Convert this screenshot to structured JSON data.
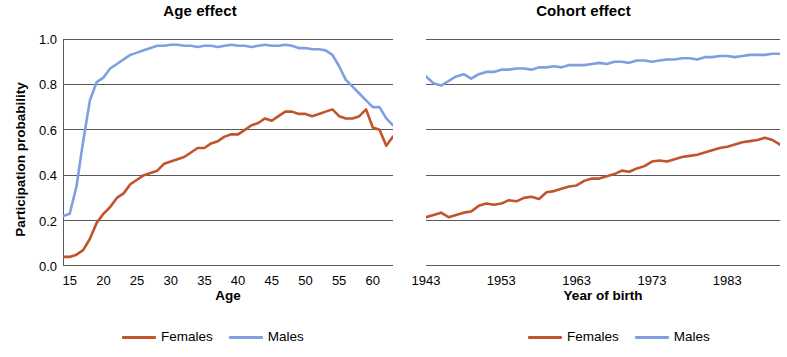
{
  "chart_data": [
    {
      "type": "line",
      "title": "Age effect",
      "xlabel": "Age",
      "ylabel": "Participation probability",
      "xlim": [
        14,
        63
      ],
      "ylim": [
        0.0,
        1.0
      ],
      "grid": true,
      "legend_position": "bottom",
      "xticks": [
        "15",
        "20",
        "25",
        "30",
        "35",
        "40",
        "45",
        "50",
        "55",
        "60"
      ],
      "xtick_values": [
        15,
        20,
        25,
        30,
        35,
        40,
        45,
        50,
        55,
        60
      ],
      "yticks": [
        "0.0",
        "0.2",
        "0.4",
        "0.6",
        "0.8",
        "1.0"
      ],
      "ytick_values": [
        0.0,
        0.2,
        0.4,
        0.6,
        0.8,
        1.0
      ],
      "x": [
        14,
        15,
        16,
        17,
        18,
        19,
        20,
        21,
        22,
        23,
        24,
        25,
        26,
        27,
        28,
        29,
        30,
        31,
        32,
        33,
        34,
        35,
        36,
        37,
        38,
        39,
        40,
        41,
        42,
        43,
        44,
        45,
        46,
        47,
        48,
        49,
        50,
        51,
        52,
        53,
        54,
        55,
        56,
        57,
        58,
        59,
        60,
        61,
        62,
        63
      ],
      "series": [
        {
          "name": "Females",
          "color": "#c0542a",
          "values": [
            0.04,
            0.04,
            0.05,
            0.07,
            0.12,
            0.19,
            0.23,
            0.26,
            0.3,
            0.32,
            0.36,
            0.38,
            0.4,
            0.41,
            0.42,
            0.45,
            0.46,
            0.47,
            0.48,
            0.5,
            0.52,
            0.52,
            0.54,
            0.55,
            0.57,
            0.58,
            0.58,
            0.6,
            0.62,
            0.63,
            0.65,
            0.64,
            0.66,
            0.68,
            0.68,
            0.67,
            0.67,
            0.66,
            0.67,
            0.68,
            0.69,
            0.66,
            0.65,
            0.65,
            0.66,
            0.69,
            0.61,
            0.6,
            0.53,
            0.57
          ]
        },
        {
          "name": "Males",
          "color": "#7e9fe0",
          "values": [
            0.22,
            0.23,
            0.35,
            0.55,
            0.73,
            0.81,
            0.83,
            0.87,
            0.89,
            0.91,
            0.93,
            0.94,
            0.95,
            0.96,
            0.97,
            0.97,
            0.975,
            0.975,
            0.97,
            0.97,
            0.965,
            0.97,
            0.97,
            0.965,
            0.97,
            0.975,
            0.97,
            0.97,
            0.965,
            0.97,
            0.975,
            0.97,
            0.97,
            0.975,
            0.97,
            0.96,
            0.96,
            0.955,
            0.955,
            0.95,
            0.93,
            0.88,
            0.82,
            0.79,
            0.76,
            0.73,
            0.7,
            0.7,
            0.65,
            0.62
          ]
        }
      ]
    },
    {
      "type": "line",
      "title": "Cohort effect",
      "xlabel": "Year of birth",
      "ylabel": "Participation probability",
      "xlim": [
        1943,
        1990
      ],
      "ylim": [
        0.0,
        1.0
      ],
      "grid": true,
      "legend_position": "bottom",
      "xticks": [
        "1943",
        "1953",
        "1963",
        "1973",
        "1983"
      ],
      "xtick_values": [
        1943,
        1953,
        1963,
        1973,
        1983
      ],
      "yticks": [
        "0.2",
        "0.4",
        "0.6",
        "0.8",
        "1.0"
      ],
      "ytick_values": [
        0.2,
        0.4,
        0.6,
        0.8,
        1.0
      ],
      "x": [
        1943,
        1944,
        1945,
        1946,
        1947,
        1948,
        1949,
        1950,
        1951,
        1952,
        1953,
        1954,
        1955,
        1956,
        1957,
        1958,
        1959,
        1960,
        1961,
        1962,
        1963,
        1964,
        1965,
        1966,
        1967,
        1968,
        1969,
        1970,
        1971,
        1972,
        1973,
        1974,
        1975,
        1976,
        1977,
        1978,
        1979,
        1980,
        1981,
        1982,
        1983,
        1984,
        1985,
        1986,
        1987,
        1988,
        1989,
        1990
      ],
      "series": [
        {
          "name": "Females",
          "color": "#c0542a",
          "values": [
            0.215,
            0.225,
            0.235,
            0.215,
            0.225,
            0.235,
            0.24,
            0.265,
            0.275,
            0.27,
            0.275,
            0.29,
            0.285,
            0.3,
            0.305,
            0.295,
            0.325,
            0.33,
            0.34,
            0.35,
            0.355,
            0.375,
            0.385,
            0.385,
            0.395,
            0.405,
            0.42,
            0.415,
            0.43,
            0.44,
            0.46,
            0.465,
            0.46,
            0.47,
            0.48,
            0.485,
            0.49,
            0.5,
            0.51,
            0.52,
            0.525,
            0.535,
            0.545,
            0.55,
            0.555,
            0.565,
            0.555,
            0.535
          ]
        },
        {
          "name": "Males",
          "color": "#7e9fe0",
          "values": [
            0.835,
            0.805,
            0.795,
            0.815,
            0.835,
            0.845,
            0.825,
            0.845,
            0.855,
            0.855,
            0.865,
            0.865,
            0.87,
            0.87,
            0.865,
            0.875,
            0.875,
            0.88,
            0.875,
            0.885,
            0.885,
            0.885,
            0.89,
            0.895,
            0.89,
            0.9,
            0.9,
            0.895,
            0.905,
            0.905,
            0.9,
            0.905,
            0.91,
            0.91,
            0.915,
            0.915,
            0.91,
            0.92,
            0.92,
            0.925,
            0.925,
            0.92,
            0.925,
            0.93,
            0.93,
            0.93,
            0.935,
            0.935
          ]
        }
      ]
    }
  ],
  "panels": [
    {
      "title": "Age effect",
      "xlabel": "Age",
      "ylabel": "Participation probability",
      "legend": [
        {
          "label": "Females",
          "color": "#c0542a"
        },
        {
          "label": "Males",
          "color": "#7e9fe0"
        }
      ]
    },
    {
      "title": "Cohort effect",
      "xlabel": "Year of birth",
      "ylabel": "Participation probability",
      "legend": [
        {
          "label": "Females",
          "color": "#c0542a"
        },
        {
          "label": "Males",
          "color": "#7e9fe0"
        }
      ]
    }
  ]
}
